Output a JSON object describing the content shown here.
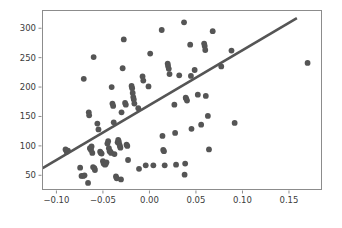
{
  "chart_data": {
    "type": "scatter",
    "title": "",
    "xlabel": "",
    "ylabel": "",
    "xlim": [
      -0.1155,
      0.1855
    ],
    "ylim": [
      25,
      331
    ],
    "grid": false,
    "legend": null,
    "marker_color": "#555555",
    "line_color": "#555555",
    "background_color": "#ffffff",
    "frame_color": "#8c8c8c",
    "xticks": [
      -0.1,
      -0.05,
      0.0,
      0.05,
      0.1,
      0.15
    ],
    "xticklabels": [
      "-0.10",
      "-0.05",
      "0.00",
      "0.05",
      "0.10",
      "0.15"
    ],
    "yticks": [
      50,
      100,
      150,
      200,
      250,
      300
    ],
    "yticklabels": [
      "50",
      "100",
      "150",
      "200",
      "250",
      "300"
    ],
    "series": [
      {
        "name": "observations",
        "marker": "circle",
        "marker_size": 4.2,
        "points": [
          [
            -0.0902,
            94
          ],
          [
            -0.089,
            90
          ],
          [
            -0.0876,
            92
          ],
          [
            -0.0745,
            63
          ],
          [
            -0.073,
            49
          ],
          [
            -0.0712,
            49
          ],
          [
            -0.0706,
            214
          ],
          [
            -0.0698,
            50
          ],
          [
            -0.066,
            37
          ],
          [
            -0.0652,
            157
          ],
          [
            -0.0648,
            152
          ],
          [
            -0.064,
            96
          ],
          [
            -0.0634,
            95
          ],
          [
            -0.0628,
            93
          ],
          [
            -0.0622,
            99
          ],
          [
            -0.0614,
            88
          ],
          [
            -0.0606,
            64
          ],
          [
            -0.06,
            251
          ],
          [
            -0.0592,
            62
          ],
          [
            -0.0586,
            59
          ],
          [
            -0.056,
            138
          ],
          [
            -0.0548,
            128
          ],
          [
            -0.053,
            90
          ],
          [
            -0.0522,
            88
          ],
          [
            -0.0514,
            87
          ],
          [
            -0.05,
            74
          ],
          [
            -0.0492,
            70
          ],
          [
            -0.0486,
            70
          ],
          [
            -0.0478,
            68
          ],
          [
            -0.047,
            69
          ],
          [
            -0.0462,
            72
          ],
          [
            -0.0452,
            104
          ],
          [
            -0.0444,
            108
          ],
          [
            -0.0436,
            96
          ],
          [
            -0.0428,
            91
          ],
          [
            -0.042,
            90
          ],
          [
            -0.0412,
            88
          ],
          [
            -0.0406,
            200
          ],
          [
            -0.0398,
            172
          ],
          [
            -0.039,
            168
          ],
          [
            -0.0384,
            140
          ],
          [
            -0.0376,
            86
          ],
          [
            -0.036,
            48
          ],
          [
            -0.0352,
            45
          ],
          [
            -0.0342,
            106
          ],
          [
            -0.0336,
            110
          ],
          [
            -0.033,
            108
          ],
          [
            -0.0324,
            103
          ],
          [
            -0.0318,
            100
          ],
          [
            -0.0312,
            97
          ],
          [
            -0.0306,
            43
          ],
          [
            -0.03,
            157
          ],
          [
            -0.0288,
            232
          ],
          [
            -0.0276,
            281
          ],
          [
            -0.0262,
            173
          ],
          [
            -0.0254,
            170
          ],
          [
            -0.0246,
            102
          ],
          [
            -0.0238,
            100
          ],
          [
            -0.023,
            76
          ],
          [
            -0.0192,
            202
          ],
          [
            -0.0186,
            198
          ],
          [
            -0.018,
            190
          ],
          [
            -0.0174,
            183
          ],
          [
            -0.0168,
            179
          ],
          [
            -0.0162,
            172
          ],
          [
            -0.012,
            164
          ],
          [
            -0.0112,
            61
          ],
          [
            -0.0074,
            218
          ],
          [
            -0.0066,
            211
          ],
          [
            -0.004,
            67
          ],
          [
            -0.001,
            201
          ],
          [
            0.0008,
            257
          ],
          [
            0.0042,
            67
          ],
          [
            0.0132,
            297
          ],
          [
            0.014,
            117
          ],
          [
            0.0148,
            93
          ],
          [
            0.0156,
            91
          ],
          [
            0.0164,
            67
          ],
          [
            0.0196,
            240
          ],
          [
            0.02,
            236
          ],
          [
            0.0208,
            231
          ],
          [
            0.0216,
            222
          ],
          [
            0.0268,
            170
          ],
          [
            0.0276,
            122
          ],
          [
            0.0286,
            68
          ],
          [
            0.032,
            220
          ],
          [
            0.0372,
            310
          ],
          [
            0.0378,
            51
          ],
          [
            0.0384,
            70
          ],
          [
            0.039,
            182
          ],
          [
            0.0396,
            180
          ],
          [
            0.0404,
            177
          ],
          [
            0.0438,
            272
          ],
          [
            0.0446,
            219
          ],
          [
            0.0452,
            129
          ],
          [
            0.0486,
            229
          ],
          [
            0.052,
            187
          ],
          [
            0.0556,
            136
          ],
          [
            0.0588,
            274
          ],
          [
            0.0594,
            270
          ],
          [
            0.06,
            263
          ],
          [
            0.0606,
            185
          ],
          [
            0.0628,
            151
          ],
          [
            0.064,
            94
          ],
          [
            0.068,
            295
          ],
          [
            0.0772,
            235
          ],
          [
            0.0882,
            262
          ],
          [
            0.0916,
            139
          ],
          [
            0.17,
            241
          ]
        ]
      }
    ],
    "fit_line": {
      "name": "regression-line",
      "x_start": -0.1148,
      "y_start": 62,
      "x_end": 0.1585,
      "y_end": 317,
      "width": 2.6
    }
  }
}
